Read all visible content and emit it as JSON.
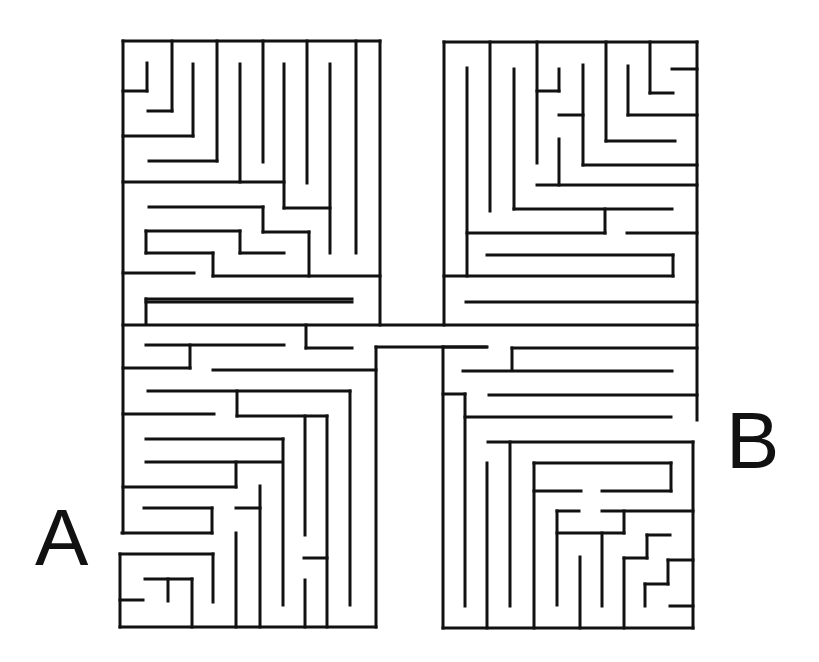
{
  "puzzle": {
    "type": "maze",
    "start_label": "A",
    "end_label": "B",
    "wall_color": "#111111",
    "background_color": "#ffffff",
    "wall_width": 3
  },
  "walls": [
    [
      123,
      41,
      380,
      41
    ],
    [
      123,
      41,
      123,
      533
    ],
    [
      380,
      41,
      380,
      325
    ],
    [
      147,
      63,
      147,
      91
    ],
    [
      123,
      91,
      147,
      91
    ],
    [
      172,
      41,
      172,
      111
    ],
    [
      148,
      111,
      172,
      111
    ],
    [
      193,
      64,
      193,
      136
    ],
    [
      123,
      136,
      193,
      136
    ],
    [
      217,
      41,
      217,
      161
    ],
    [
      149,
      161,
      217,
      161
    ],
    [
      240,
      64,
      240,
      182
    ],
    [
      123,
      182,
      284,
      182
    ],
    [
      263,
      41,
      263,
      162
    ],
    [
      284,
      64,
      284,
      208
    ],
    [
      284,
      208,
      330,
      208
    ],
    [
      307,
      41,
      307,
      183
    ],
    [
      330,
      64,
      330,
      253
    ],
    [
      356,
      41,
      356,
      253
    ],
    [
      149,
      207,
      263,
      207
    ],
    [
      263,
      207,
      263,
      232
    ],
    [
      263,
      232,
      309,
      232
    ],
    [
      309,
      232,
      309,
      276
    ],
    [
      146,
      231,
      240,
      231
    ],
    [
      240,
      231,
      240,
      253
    ],
    [
      240,
      253,
      284,
      253
    ],
    [
      146,
      231,
      146,
      253
    ],
    [
      146,
      253,
      213,
      253
    ],
    [
      213,
      253,
      213,
      276
    ],
    [
      213,
      276,
      380,
      276
    ],
    [
      123,
      273,
      194,
      273
    ],
    [
      146,
      299,
      352,
      299
    ],
    [
      146,
      299,
      146,
      324
    ],
    [
      123,
      325,
      697,
      325
    ],
    [
      306,
      325,
      306,
      348
    ],
    [
      306,
      348,
      352,
      348
    ],
    [
      146,
      345,
      284,
      345
    ],
    [
      190,
      345,
      190,
      368
    ],
    [
      123,
      368,
      190,
      368
    ],
    [
      376,
      347,
      486,
      347
    ],
    [
      376,
      347,
      376,
      627
    ],
    [
      213,
      370,
      376,
      370
    ],
    [
      148,
      391,
      350,
      391
    ],
    [
      350,
      391,
      350,
      605
    ],
    [
      237,
      391,
      237,
      416
    ],
    [
      237,
      416,
      327,
      416
    ],
    [
      327,
      416,
      327,
      627
    ],
    [
      305,
      416,
      305,
      535
    ],
    [
      305,
      580,
      305,
      627
    ],
    [
      123,
      414,
      214,
      414
    ],
    [
      146,
      439,
      283,
      439
    ],
    [
      283,
      439,
      283,
      605
    ],
    [
      146,
      462,
      281,
      462
    ],
    [
      236,
      462,
      236,
      487
    ],
    [
      123,
      487,
      236,
      487
    ],
    [
      260,
      486,
      260,
      627
    ],
    [
      236,
      508,
      260,
      508
    ],
    [
      144,
      508,
      212,
      508
    ],
    [
      212,
      508,
      212,
      533
    ],
    [
      122,
      533,
      212,
      533
    ],
    [
      236,
      533,
      236,
      627
    ],
    [
      304,
      558,
      327,
      558
    ],
    [
      120,
      554,
      213,
      554
    ],
    [
      213,
      554,
      213,
      602
    ],
    [
      120,
      554,
      120,
      627
    ],
    [
      120,
      627,
      376,
      627
    ],
    [
      145,
      579,
      192,
      579
    ],
    [
      192,
      579,
      192,
      627
    ],
    [
      168,
      579,
      168,
      601
    ],
    [
      120,
      600,
      143,
      600
    ],
    [
      444,
      42,
      697,
      42
    ],
    [
      444,
      42,
      444,
      325
    ],
    [
      697,
      42,
      697,
      420
    ],
    [
      467,
      68,
      467,
      276
    ],
    [
      490,
      42,
      490,
      211
    ],
    [
      514,
      69,
      514,
      209
    ],
    [
      514,
      209,
      672,
      209
    ],
    [
      537,
      42,
      537,
      163
    ],
    [
      537,
      91,
      559,
      91
    ],
    [
      559,
      69,
      559,
      91
    ],
    [
      583,
      65,
      583,
      165
    ],
    [
      559,
      115,
      583,
      115
    ],
    [
      583,
      165,
      697,
      165
    ],
    [
      606,
      42,
      606,
      141
    ],
    [
      606,
      141,
      675,
      141
    ],
    [
      628,
      66,
      628,
      115
    ],
    [
      628,
      115,
      697,
      115
    ],
    [
      650,
      42,
      650,
      93
    ],
    [
      650,
      93,
      673,
      93
    ],
    [
      672,
      69,
      697,
      69
    ],
    [
      559,
      139,
      559,
      185
    ],
    [
      537,
      185,
      697,
      185
    ],
    [
      605,
      209,
      605,
      233
    ],
    [
      467,
      233,
      605,
      233
    ],
    [
      627,
      233,
      697,
      233
    ],
    [
      444,
      276,
      673,
      276
    ],
    [
      673,
      255,
      673,
      276
    ],
    [
      487,
      255,
      673,
      255
    ],
    [
      466,
      302,
      697,
      302
    ],
    [
      352,
      302,
      146,
      302
    ],
    [
      443,
      347,
      443,
      628
    ],
    [
      443,
      347,
      487,
      347
    ],
    [
      512,
      348,
      512,
      370
    ],
    [
      512,
      348,
      697,
      348
    ],
    [
      463,
      371,
      672,
      371
    ],
    [
      489,
      395,
      697,
      395
    ],
    [
      443,
      394,
      465,
      394
    ],
    [
      465,
      394,
      465,
      606
    ],
    [
      465,
      417,
      671,
      417
    ],
    [
      488,
      442,
      693,
      442
    ],
    [
      693,
      442,
      693,
      628
    ],
    [
      510,
      442,
      510,
      606
    ],
    [
      487,
      463,
      487,
      628
    ],
    [
      534,
      463,
      671,
      463
    ],
    [
      671,
      463,
      671,
      491
    ],
    [
      602,
      491,
      671,
      491
    ],
    [
      534,
      463,
      534,
      628
    ],
    [
      534,
      491,
      581,
      491
    ],
    [
      557,
      511,
      579,
      511
    ],
    [
      557,
      511,
      557,
      605
    ],
    [
      602,
      511,
      693,
      511
    ],
    [
      624,
      511,
      624,
      533
    ],
    [
      557,
      533,
      624,
      533
    ],
    [
      602,
      533,
      602,
      606
    ],
    [
      580,
      557,
      580,
      628
    ],
    [
      647,
      535,
      670,
      535
    ],
    [
      647,
      535,
      647,
      558
    ],
    [
      624,
      558,
      647,
      558
    ],
    [
      624,
      558,
      624,
      628
    ],
    [
      668,
      560,
      693,
      560
    ],
    [
      668,
      560,
      668,
      584
    ],
    [
      645,
      584,
      668,
      584
    ],
    [
      645,
      584,
      645,
      606
    ],
    [
      670,
      606,
      693,
      606
    ],
    [
      443,
      628,
      693,
      628
    ]
  ]
}
